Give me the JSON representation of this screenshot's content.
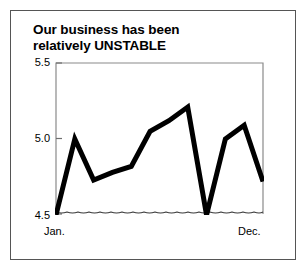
{
  "chart_data": {
    "type": "line",
    "title": "Our business has been relatively UNSTABLE",
    "title_lines": [
      "Our business has been",
      "relatively UNSTABLE"
    ],
    "xlabel": "",
    "ylabel": "",
    "categories": [
      "Jan.",
      "Feb.",
      "Mar.",
      "Apr.",
      "May",
      "Jun.",
      "Jul.",
      "Aug.",
      "Sep.",
      "Oct.",
      "Nov.",
      "Dec."
    ],
    "x_tick_labels_shown": [
      "Jan.",
      "Dec."
    ],
    "y_tick_labels": [
      "5.5",
      "5.0",
      "4.5"
    ],
    "ylim": [
      4.5,
      5.5
    ],
    "y_ticks": [
      4.5,
      5.0,
      5.5
    ],
    "grid": false,
    "legend": false,
    "broken_axis_baseline": true,
    "line_color": "#000000",
    "line_width_px": 5,
    "series": [
      {
        "name": "Business index",
        "values": [
          4.5,
          5.0,
          4.73,
          4.78,
          4.82,
          5.05,
          5.12,
          5.21,
          4.5,
          5.0,
          5.09,
          4.72
        ]
      }
    ],
    "annotations": [
      "Baseline drawn as a wavy squiggle to indicate a truncated (non-zero) y-axis"
    ]
  },
  "axis": {
    "y_top_label": "5.5",
    "y_mid_label": "5.0",
    "y_bottom_label": "4.5",
    "x_start_label": "Jan.",
    "x_end_label": "Dec."
  },
  "colors": {
    "line": "#000000",
    "axis": "#808080",
    "frame": "#555555",
    "text": "#000000",
    "background": "#ffffff"
  }
}
